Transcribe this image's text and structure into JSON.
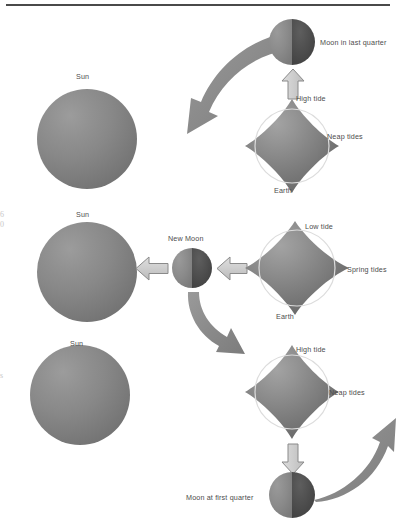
{
  "figure": {
    "background_color": "#ffffff",
    "rule_color": "#4a4a4a"
  },
  "palette": {
    "body_dark": "#6f6f6f",
    "body_light": "#9c9c9c",
    "moon_lit": "#8d8d8d",
    "moon_dark": "#4a4a4a",
    "block_arrow_fill": "#cfcfcf",
    "block_arrow_stroke": "#8a8a8a",
    "curved_arrow_fill": "#8b8b8b",
    "label_color": "#4d4d4d",
    "tide_ring": "#d9d9d9"
  },
  "edge_marks": [
    {
      "text": "6",
      "top": 212
    },
    {
      "text": "0",
      "top": 222
    },
    {
      "text": "s",
      "top": 372
    }
  ],
  "rows": [
    {
      "id": "row-last-quarter",
      "sun": {
        "label": "Sun",
        "cx": 87,
        "cy": 139,
        "r": 50
      },
      "moon": {
        "label": "Moon in last quarter",
        "cx": 292,
        "cy": 42,
        "r": 23,
        "lit_side": "left"
      },
      "earth": {
        "label": "Earth",
        "cx": 292,
        "cy": 146,
        "tide_label_top": "High tide",
        "tide_label_side": "Neap tides",
        "tide_type": "neap",
        "bulge_axis": "vertical"
      },
      "block_arrow": {
        "direction": "up",
        "label": ""
      },
      "curved_arrow": {
        "direction": "down-left"
      }
    },
    {
      "id": "row-new-moon",
      "sun": {
        "label": "Sun",
        "cx": 87,
        "cy": 272,
        "r": 50
      },
      "moon": {
        "label": "New Moon",
        "cx": 192,
        "cy": 268,
        "r": 20,
        "lit_side": "left"
      },
      "earth": {
        "label": "Earth",
        "cx": 297,
        "cy": 268,
        "tide_label_top": "Low tide",
        "tide_label_side": "Spring tides",
        "tide_type": "spring",
        "bulge_axis": "horizontal"
      },
      "block_arrow": {
        "direction": "left",
        "label": ""
      },
      "curved_arrow": {
        "direction": "down-right"
      }
    },
    {
      "id": "row-first-quarter",
      "sun": {
        "label": "Sun",
        "cx": 80,
        "cy": 395,
        "r": 50
      },
      "moon": {
        "label": "Moon at first quarter",
        "cx": 292,
        "cy": 495,
        "r": 23,
        "lit_side": "left"
      },
      "earth": {
        "label": "Earth",
        "cx": 292,
        "cy": 392,
        "tide_label_top": "High tide",
        "tide_label_side": "Neap tides",
        "tide_type": "neap",
        "bulge_axis": "vertical"
      },
      "block_arrow": {
        "direction": "down",
        "label": ""
      },
      "curved_arrow": {
        "direction": "up-right"
      }
    }
  ],
  "labels": {
    "sun": "Sun",
    "earth": "Earth",
    "moon_last_quarter": "Moon in last quarter",
    "moon_new": "New Moon",
    "moon_first_quarter": "Moon at first quarter",
    "high_tide": "High tide",
    "low_tide": "Low tide",
    "neap_tides": "Neap tides",
    "spring_tides": "Spring tides"
  }
}
